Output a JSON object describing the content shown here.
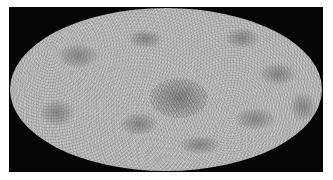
{
  "image": {
    "description": "Full-sky Mollweide projection of a grayscale noisy temperature map (cosmic microwave background style) on a black rectangular background",
    "projection": "mollweide",
    "colors": {
      "background": "#ffffff",
      "frame": "#050505",
      "map_base": "#b9b9b9",
      "dark_spots": "#464646",
      "light_spots": "#e6e6e6"
    },
    "blobs": [
      {
        "name": "upper-left-cold-spot",
        "x": 48,
        "y": 36,
        "w": 40,
        "h": 24
      },
      {
        "name": "upper-center-cold-spot",
        "x": 118,
        "y": 22,
        "w": 34,
        "h": 18
      },
      {
        "name": "upper-right-cold-spot",
        "x": 215,
        "y": 20,
        "w": 34,
        "h": 20
      },
      {
        "name": "right-cold-spot",
        "x": 250,
        "y": 55,
        "w": 36,
        "h": 22
      },
      {
        "name": "center-cold-spot",
        "x": 140,
        "y": 70,
        "w": 58,
        "h": 40
      },
      {
        "name": "left-lower-cold-spot",
        "x": 30,
        "y": 92,
        "w": 34,
        "h": 26
      },
      {
        "name": "lower-center-cold-spot",
        "x": 110,
        "y": 105,
        "w": 38,
        "h": 22
      },
      {
        "name": "lower-right-cold-spot",
        "x": 225,
        "y": 100,
        "w": 40,
        "h": 22
      },
      {
        "name": "far-right-cold-spot",
        "x": 280,
        "y": 85,
        "w": 26,
        "h": 28
      },
      {
        "name": "bottom-cold-spot",
        "x": 170,
        "y": 128,
        "w": 40,
        "h": 18
      }
    ]
  }
}
